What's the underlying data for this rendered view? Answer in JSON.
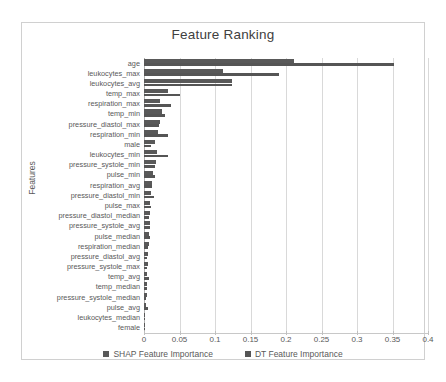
{
  "chart_data": {
    "type": "bar",
    "orientation": "horizontal",
    "title": "Feature Ranking",
    "xlabel": "",
    "ylabel": "Features",
    "xlim": [
      0,
      0.4
    ],
    "xticks": [
      0,
      0.05,
      0.1,
      0.15,
      0.2,
      0.25,
      0.3,
      0.35,
      0.4
    ],
    "xtick_labels": [
      "0",
      "0.05",
      "0.1",
      "0.15",
      "0.2",
      "0.25",
      "0.3",
      "0.35",
      "0.4"
    ],
    "grid": true,
    "legend_position": "bottom",
    "categories": [
      "age",
      "leukocytes_max",
      "leukocytes_avg",
      "temp_max",
      "respiration_max",
      "temp_min",
      "pressure_diastol_max",
      "respiration_min",
      "male",
      "leukocytes_min",
      "pressure_systole_min",
      "pulse_min",
      "respiration_avg",
      "pressure_diastol_min",
      "pulse_max",
      "pressure_diastol_median",
      "pressure_systole_avg",
      "pulse_median",
      "respiration_median",
      "pressure_diastol_avg",
      "pressure_systole_max",
      "temp_avg",
      "temp_median",
      "pressure_systole_median",
      "pulse_avg",
      "leukocytes_median",
      "female"
    ],
    "series": [
      {
        "name": "SHAP Feature Importance",
        "color": "#595959",
        "values": [
          0.211,
          0.111,
          0.124,
          0.034,
          0.022,
          0.026,
          0.023,
          0.02,
          0.015,
          0.018,
          0.017,
          0.012,
          0.011,
          0.01,
          0.009,
          0.009,
          0.008,
          0.007,
          0.007,
          0.006,
          0.005,
          0.004,
          0.004,
          0.004,
          0.003,
          0.001,
          0.001
        ]
      },
      {
        "name": "DT Feature Importance",
        "color": "#555555",
        "values": [
          0.352,
          0.19,
          0.124,
          0.051,
          0.038,
          0.029,
          0.021,
          0.034,
          0.01,
          0.034,
          0.016,
          0.015,
          0.011,
          0.014,
          0.01,
          0.007,
          0.009,
          0.009,
          0.006,
          0.004,
          0.004,
          0.007,
          0.004,
          0.003,
          0.005,
          0.002,
          0.001
        ]
      }
    ]
  },
  "legend": {
    "items": [
      {
        "label": "SHAP Feature Importance",
        "color": "#595959"
      },
      {
        "label": "DT Feature Importance",
        "color": "#555555"
      }
    ]
  }
}
